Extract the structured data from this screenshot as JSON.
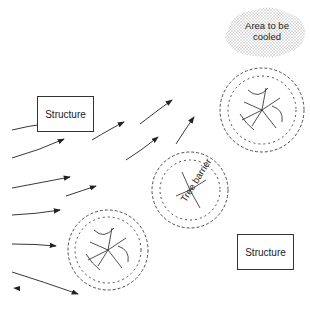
{
  "diagram": {
    "cooled_area": {
      "label_line1": "Area to be",
      "label_line2": "cooled"
    },
    "structure_top": {
      "label": "Structure"
    },
    "structure_bottom": {
      "label": "Structure"
    },
    "tree_barrier": {
      "label": "Tree barrier",
      "count": 3
    },
    "wind_arrows": {
      "count": 12,
      "direction": "deflected upward over tree barrier toward cooled area"
    },
    "colors": {
      "line": "#333333",
      "stipple": "#c8c8c8",
      "background": "#ffffff"
    }
  }
}
